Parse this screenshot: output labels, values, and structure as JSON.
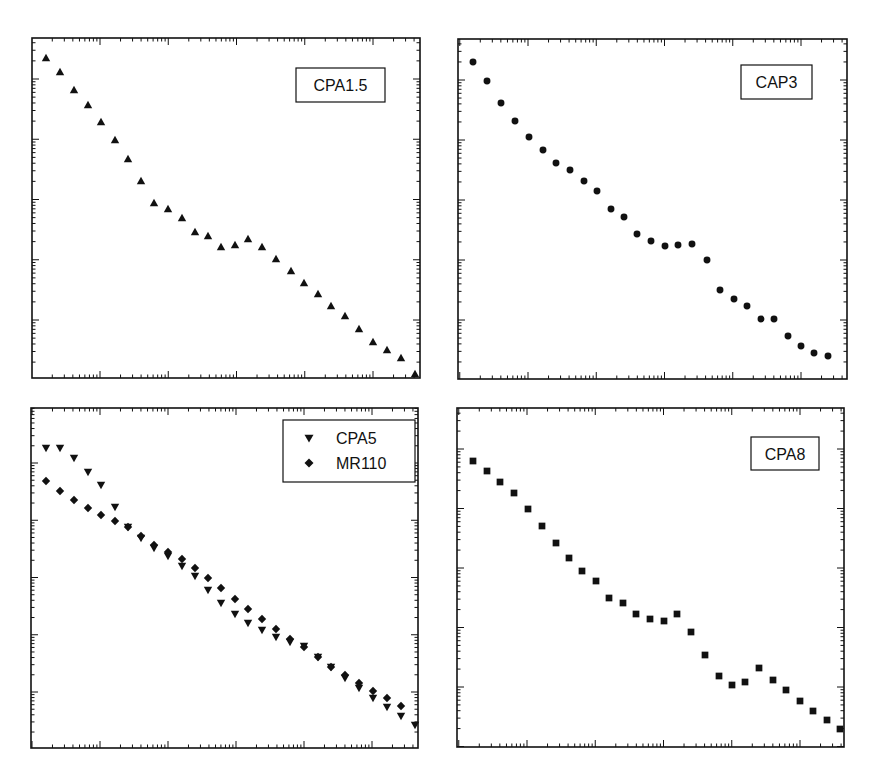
{
  "figure": {
    "background": "#ffffff",
    "ink": "#111111"
  },
  "chart_data": [
    {
      "type": "scatter",
      "title": "",
      "label": "CPA1.5",
      "xlabel": "",
      "ylabel": "",
      "xscale": "log",
      "yscale": "log",
      "grid": false,
      "legend_position": "upper right (boxed label)",
      "frame": {
        "x": 32,
        "y": 38,
        "w": 388,
        "h": 340
      },
      "x_major_px": [
        100,
        168,
        236,
        304,
        373
      ],
      "y_major_px": [
        79,
        140,
        200,
        260,
        320
      ],
      "series": [
        {
          "name": "CPA1.5",
          "marker": "triangle-up",
          "points_px": [
            [
              46,
              58
            ],
            [
              60,
              72
            ],
            [
              74,
              90
            ],
            [
              88,
              105
            ],
            [
              101,
              122
            ],
            [
              115,
              140
            ],
            [
              128,
              159
            ],
            [
              141,
              181
            ],
            [
              154,
              203
            ],
            [
              168,
              209
            ],
            [
              182,
              218
            ],
            [
              195,
              232
            ],
            [
              208,
              236
            ],
            [
              221,
              247
            ],
            [
              235,
              245
            ],
            [
              248,
              239
            ],
            [
              262,
              247
            ],
            [
              276,
              259
            ],
            [
              291,
              271
            ],
            [
              304,
              283
            ],
            [
              318,
              294
            ],
            [
              331,
              306
            ],
            [
              345,
              316
            ],
            [
              359,
              329
            ],
            [
              373,
              342
            ],
            [
              387,
              350
            ],
            [
              401,
              358
            ],
            [
              415,
              374
            ]
          ]
        }
      ],
      "legend_box": {
        "x": 296,
        "y": 68,
        "w": 89,
        "h": 34
      }
    },
    {
      "type": "scatter",
      "title": "",
      "label": "CAP3",
      "xlabel": "",
      "ylabel": "",
      "xscale": "log",
      "yscale": "log",
      "grid": false,
      "legend_position": "upper right (boxed label)",
      "frame": {
        "x": 458,
        "y": 39,
        "w": 389,
        "h": 340
      },
      "x_major_px": [
        528,
        596,
        665,
        733,
        801
      ],
      "y_major_px": [
        80,
        140,
        200,
        260,
        320
      ],
      "series": [
        {
          "name": "CAP3",
          "marker": "circle",
          "points_px": [
            [
              473,
              62
            ],
            [
              487,
              81
            ],
            [
              501,
              103
            ],
            [
              515,
              121
            ],
            [
              529,
              137
            ],
            [
              543,
              150
            ],
            [
              556,
              163
            ],
            [
              570,
              170
            ],
            [
              584,
              181
            ],
            [
              597,
              191
            ],
            [
              611,
              209
            ],
            [
              624,
              217
            ],
            [
              637,
              234
            ],
            [
              651,
              241
            ],
            [
              665,
              246
            ],
            [
              678,
              245
            ],
            [
              692,
              244
            ],
            [
              707,
              260
            ],
            [
              720,
              290
            ],
            [
              734,
              299
            ],
            [
              747,
              306
            ],
            [
              761,
              319
            ],
            [
              774,
              319
            ],
            [
              788,
              336
            ],
            [
              801,
              346
            ],
            [
              814,
              353
            ],
            [
              828,
              356
            ]
          ]
        }
      ],
      "legend_box": {
        "x": 741,
        "y": 65,
        "w": 71,
        "h": 34
      }
    },
    {
      "type": "scatter",
      "title": "",
      "label": "",
      "xlabel": "",
      "ylabel": "",
      "xscale": "log",
      "yscale": "log",
      "grid": false,
      "legend_position": "upper right",
      "frame": {
        "x": 31,
        "y": 408,
        "w": 387,
        "h": 340
      },
      "x_major_px": [
        100,
        167,
        235,
        303,
        372
      ],
      "y_major_px": [
        463,
        522,
        579,
        635,
        692
      ],
      "series": [
        {
          "name": "CPA5",
          "marker": "triangle-down",
          "points_px": [
            [
              46,
              448
            ],
            [
              60,
              448
            ],
            [
              74,
              458
            ],
            [
              88,
              472
            ],
            [
              101,
              485
            ],
            [
              115,
              507
            ],
            [
              128,
              527
            ],
            [
              141,
              538
            ],
            [
              154,
              548
            ],
            [
              168,
              556
            ],
            [
              182,
              566
            ],
            [
              195,
              576
            ],
            [
              208,
              590
            ],
            [
              221,
              603
            ],
            [
              235,
              614
            ],
            [
              248,
              623
            ],
            [
              262,
              630
            ],
            [
              276,
              637
            ],
            [
              290,
              642
            ],
            [
              304,
              646
            ],
            [
              318,
              657
            ],
            [
              331,
              667
            ],
            [
              345,
              678
            ],
            [
              359,
              688
            ],
            [
              373,
              698
            ],
            [
              387,
              707
            ],
            [
              401,
              716
            ],
            [
              415,
              725
            ]
          ]
        },
        {
          "name": "MR110",
          "marker": "diamond",
          "points_px": [
            [
              46,
              481
            ],
            [
              60,
              491
            ],
            [
              74,
              500
            ],
            [
              88,
              508
            ],
            [
              101,
              515
            ],
            [
              115,
              521
            ],
            [
              128,
              527
            ],
            [
              141,
              536
            ],
            [
              154,
              545
            ],
            [
              168,
              552
            ],
            [
              182,
              559
            ],
            [
              195,
              568
            ],
            [
              208,
              578
            ],
            [
              221,
              588
            ],
            [
              235,
              599
            ],
            [
              248,
              609
            ],
            [
              262,
              619
            ],
            [
              276,
              629
            ],
            [
              290,
              639
            ],
            [
              304,
              647
            ],
            [
              318,
              657
            ],
            [
              331,
              667
            ],
            [
              345,
              675
            ],
            [
              359,
              683
            ],
            [
              373,
              691
            ],
            [
              387,
              698
            ],
            [
              401,
              706
            ]
          ]
        }
      ],
      "legend": {
        "box": {
          "x": 283,
          "y": 420,
          "w": 132,
          "h": 62
        },
        "entries": [
          {
            "name": "CPA5",
            "marker": "triangle-down"
          },
          {
            "name": "MR110",
            "marker": "diamond"
          }
        ]
      }
    },
    {
      "type": "scatter",
      "title": "",
      "label": "CPA8",
      "xlabel": "",
      "ylabel": "",
      "xscale": "log",
      "yscale": "log",
      "grid": false,
      "legend_position": "upper right (boxed label)",
      "frame": {
        "x": 457,
        "y": 408,
        "w": 387,
        "h": 339
      },
      "x_major_px": [
        527,
        595,
        664,
        732,
        800
      ],
      "y_major_px": [
        449,
        509,
        569,
        628,
        687
      ],
      "series": [
        {
          "name": "CPA8",
          "marker": "square",
          "points_px": [
            [
              473,
              461
            ],
            [
              487,
              471
            ],
            [
              500,
              482
            ],
            [
              514,
              493
            ],
            [
              528,
              509
            ],
            [
              542,
              526
            ],
            [
              556,
              543
            ],
            [
              569,
              558
            ],
            [
              582,
              571
            ],
            [
              596,
              581
            ],
            [
              609,
              598
            ],
            [
              623,
              603
            ],
            [
              636,
              614
            ],
            [
              650,
              619
            ],
            [
              664,
              621
            ],
            [
              677,
              614
            ],
            [
              691,
              632
            ],
            [
              705,
              655
            ],
            [
              719,
              676
            ],
            [
              732,
              685
            ],
            [
              745,
              682
            ],
            [
              759,
              668
            ],
            [
              773,
              680
            ],
            [
              786,
              690
            ],
            [
              800,
              701
            ],
            [
              813,
              711
            ],
            [
              827,
              720
            ],
            [
              840,
              729
            ]
          ]
        }
      ],
      "legend_box": {
        "x": 751,
        "y": 437,
        "w": 68,
        "h": 33
      }
    }
  ]
}
